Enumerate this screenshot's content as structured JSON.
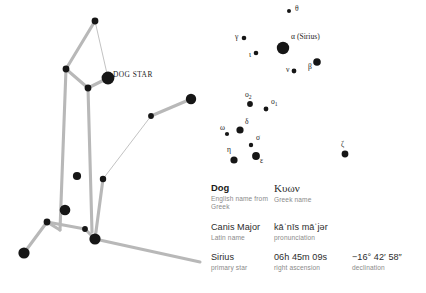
{
  "colors": {
    "background": "#ffffff",
    "star": "#161616",
    "connector_thick": "#b8b8b8",
    "connector_thin": "#adadad",
    "term_text": "#2c2c2c",
    "caption_text": "#8a8a8a"
  },
  "figure_map": {
    "label": "DOG STAR",
    "label_pos": {
      "x": 113,
      "y": 77
    },
    "stars": [
      {
        "name": "node-head-top",
        "x": 95,
        "y": 21,
        "r": 3.4
      },
      {
        "name": "node-neck",
        "x": 66,
        "y": 69,
        "r": 3.4
      },
      {
        "name": "node-chest",
        "x": 88,
        "y": 88,
        "r": 3.4
      },
      {
        "name": "node-dog-star",
        "x": 108,
        "y": 78,
        "r": 6.4
      },
      {
        "name": "node-tail-mid",
        "x": 151,
        "y": 116,
        "r": 2.9
      },
      {
        "name": "node-tail-end",
        "x": 191,
        "y": 99,
        "r": 5.2
      },
      {
        "name": "node-body-inner",
        "x": 77,
        "y": 176,
        "r": 4.1
      },
      {
        "name": "node-body-right",
        "x": 103,
        "y": 179,
        "r": 3.2
      },
      {
        "name": "node-belly",
        "x": 65,
        "y": 210,
        "r": 5.3
      },
      {
        "name": "node-hip",
        "x": 47,
        "y": 222,
        "r": 3.4
      },
      {
        "name": "node-knee",
        "x": 85,
        "y": 229,
        "r": 2.9
      },
      {
        "name": "node-foot-rear",
        "x": 95,
        "y": 239,
        "r": 5.6
      },
      {
        "name": "node-foot-front",
        "x": 24,
        "y": 253,
        "r": 5.6
      }
    ],
    "connections_thick": [
      [
        95,
        21,
        66,
        69
      ],
      [
        66,
        69,
        88,
        88
      ],
      [
        88,
        88,
        108,
        78
      ],
      [
        151,
        116,
        191,
        99
      ],
      [
        66,
        69,
        60,
        230
      ],
      [
        88,
        88,
        92,
        232
      ],
      [
        60,
        230,
        47,
        222
      ],
      [
        47,
        222,
        85,
        229
      ],
      [
        85,
        229,
        95,
        239
      ],
      [
        47,
        222,
        24,
        253
      ],
      [
        95,
        239,
        103,
        179
      ],
      [
        95,
        239,
        200,
        262
      ]
    ],
    "connections_thin": [
      [
        95,
        21,
        108,
        78
      ],
      [
        103,
        179,
        151,
        116
      ]
    ]
  },
  "star_field": {
    "stars": [
      {
        "name": "theta",
        "label": "θ",
        "sub": "",
        "x": 74,
        "y": 11,
        "r": 2.0,
        "lx": 80,
        "ly": 11
      },
      {
        "name": "gamma",
        "label": "γ",
        "sub": "",
        "x": 29,
        "y": 38,
        "r": 2.3,
        "lx": 20,
        "ly": 39
      },
      {
        "name": "alpha",
        "label": "α (Sirius)",
        "sub": "",
        "x": 68,
        "y": 48,
        "r": 6.2,
        "lx": 76,
        "ly": 39
      },
      {
        "name": "iota",
        "label": "ι",
        "sub": "",
        "x": 41,
        "y": 53,
        "r": 2.3,
        "lx": 34,
        "ly": 57
      },
      {
        "name": "beta",
        "label": "β",
        "sub": "",
        "x": 102,
        "y": 62,
        "r": 3.8,
        "lx": 93,
        "ly": 69
      },
      {
        "name": "nu",
        "label": "ν",
        "sub": "",
        "x": 79,
        "y": 71,
        "r": 2.4,
        "lx": 71,
        "ly": 72
      },
      {
        "name": "omicron-2",
        "label": "ο",
        "sub": "2",
        "x": 35,
        "y": 104,
        "r": 2.9,
        "lx": 30,
        "ly": 97
      },
      {
        "name": "omicron-1",
        "label": "ο",
        "sub": "1",
        "x": 51,
        "y": 109,
        "r": 2.4,
        "lx": 56,
        "ly": 104
      },
      {
        "name": "delta",
        "label": "δ",
        "sub": "",
        "x": 25,
        "y": 130,
        "r": 3.6,
        "lx": 30,
        "ly": 124
      },
      {
        "name": "omega",
        "label": "ω",
        "sub": "",
        "x": 12,
        "y": 134,
        "r": 2.1,
        "lx": 5,
        "ly": 130
      },
      {
        "name": "sigma",
        "label": "σ",
        "sub": "",
        "x": 36,
        "y": 145,
        "r": 2.2,
        "lx": 41,
        "ly": 140
      },
      {
        "name": "epsilon",
        "label": "ε",
        "sub": "",
        "x": 41,
        "y": 156,
        "r": 3.9,
        "lx": 45,
        "ly": 163
      },
      {
        "name": "eta",
        "label": "η",
        "sub": "",
        "x": 19,
        "y": 160,
        "r": 3.6,
        "lx": 12,
        "ly": 152
      },
      {
        "name": "zeta",
        "label": "ζ",
        "sub": "",
        "x": 130,
        "y": 154,
        "r": 3.4,
        "lx": 126,
        "ly": 147
      }
    ]
  },
  "info": {
    "rows": [
      {
        "name": "name-row",
        "cells": [
          {
            "name": "english-name",
            "term": "Dog",
            "caption": "English name from Greek",
            "style": "bold",
            "two_line": true
          },
          {
            "name": "greek-name",
            "term": "Κυων",
            "caption": "Greek name",
            "style": "greek",
            "two_line": false
          }
        ]
      },
      {
        "name": "latin-row",
        "cells": [
          {
            "name": "latin-name",
            "term": "Canis Major",
            "caption": "Latin name",
            "style": "plain",
            "two_line": false
          },
          {
            "name": "pronunciation",
            "term": "kāˈnīs māˈjər",
            "caption": "pronunciation",
            "style": "plain",
            "two_line": false
          }
        ]
      },
      {
        "name": "star-row",
        "cells": [
          {
            "name": "primary-star",
            "term": "Sirius",
            "caption": "primary star",
            "style": "plain",
            "two_line": false
          },
          {
            "name": "right-ascension",
            "term": "06h 45m 09s",
            "caption": "right ascension",
            "style": "plain",
            "two_line": false
          },
          {
            "name": "declination",
            "term": "−16° 42′ 58″",
            "caption": "declination",
            "style": "plain",
            "two_line": false
          }
        ]
      }
    ]
  }
}
